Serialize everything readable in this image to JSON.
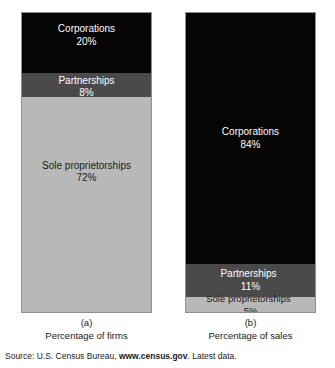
{
  "figure": {
    "background": "#ffffff",
    "colors": {
      "corporations": "#050505",
      "partnerships": "#4a4a4a",
      "sole_proprietorships": "#b8b8b8",
      "border": "#8f8f8f",
      "light_text": "#ffffff",
      "dark_text": "#1a1a1a"
    }
  },
  "charts": [
    {
      "id": "firms",
      "caption_letter": "(a)",
      "caption_text": "Percentage of firms",
      "segments": [
        {
          "name": "corporations",
          "label": "Corporations",
          "percent_label": "20%",
          "value": 20,
          "color": "#050505",
          "text_color": "#ffffff",
          "layout": "stacked"
        },
        {
          "name": "partnerships",
          "label": "Partnerships",
          "percent_label": "8%",
          "value": 8,
          "color": "#4a4a4a",
          "text_color": "#ffffff",
          "layout": "stacked"
        },
        {
          "name": "sole-proprietorships",
          "label": "Sole proprietorships",
          "percent_label": "72%",
          "value": 72,
          "color": "#b8b8b8",
          "text_color": "#1a1a1a",
          "layout": "stacked"
        }
      ]
    },
    {
      "id": "sales",
      "caption_letter": "(b)",
      "caption_text": "Percentage of sales",
      "segments": [
        {
          "name": "corporations",
          "label": "Corporations",
          "percent_label": "84%",
          "value": 84,
          "color": "#050505",
          "text_color": "#ffffff",
          "layout": "stacked"
        },
        {
          "name": "partnerships",
          "label": "Partnerships",
          "percent_label": "11%",
          "value": 11,
          "color": "#4a4a4a",
          "text_color": "#ffffff",
          "layout": "inline"
        },
        {
          "name": "sole-proprietorships",
          "label": "Sole proprietorships",
          "percent_label": "5%",
          "value": 5,
          "color": "#b8b8b8",
          "text_color": "#1a1a1a",
          "layout": "inline"
        }
      ]
    }
  ],
  "source": {
    "prefix": "Source: U.S. Census Bureau, ",
    "site": "www.census.gov",
    "suffix": ". Latest data."
  },
  "chart_data": {
    "type": "bar",
    "title": "",
    "subtitle": "",
    "xlabel": "",
    "ylabel": "",
    "ylim": [
      0,
      100
    ],
    "grid": false,
    "legend": "none",
    "stacked": true,
    "orientation": "vertical",
    "categories": [
      "Percentage of firms",
      "Percentage of sales"
    ],
    "series": [
      {
        "name": "Corporations",
        "values": [
          20,
          84
        ]
      },
      {
        "name": "Partnerships",
        "values": [
          8,
          11
        ]
      },
      {
        "name": "Sole proprietorships",
        "values": [
          72,
          5
        ]
      }
    ],
    "annotations": [
      "Corporations 20%",
      "Partnerships 8%",
      "Sole proprietorships 72%",
      "Corporations 84%",
      "Partnerships 11%",
      "Sole proprietorships 5%",
      "(a)",
      "(b)"
    ]
  }
}
